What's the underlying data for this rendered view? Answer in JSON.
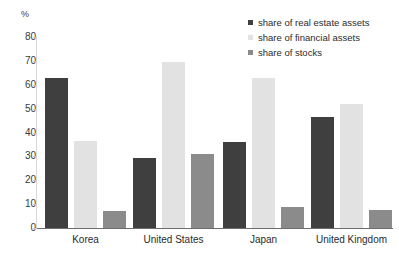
{
  "chart_data": {
    "type": "bar",
    "title": "",
    "xlabel": "",
    "ylabel": "%",
    "ylim": [
      0,
      80
    ],
    "yticks": [
      0,
      10,
      20,
      30,
      40,
      50,
      60,
      70,
      80
    ],
    "grid": false,
    "legend_position": "top-right",
    "categories": [
      "Korea",
      "United States",
      "Japan",
      "United Kingdom"
    ],
    "series": [
      {
        "name": "share of real estate assets",
        "color": "#3f3f3f",
        "values": [
          63,
          29.5,
          36,
          46.5
        ]
      },
      {
        "name": "share of financial assets",
        "color": "#e2e2e2",
        "values": [
          36.5,
          69.5,
          63,
          52
        ]
      },
      {
        "name": "share of stocks",
        "color": "#8b8b8b",
        "values": [
          7,
          31,
          9,
          7.5
        ]
      }
    ]
  }
}
